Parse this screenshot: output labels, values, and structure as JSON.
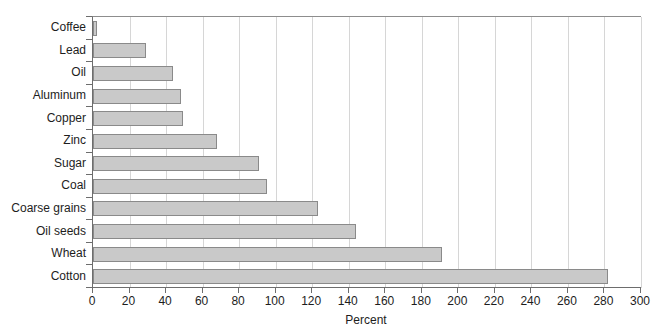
{
  "chart_data": {
    "type": "bar",
    "orientation": "horizontal",
    "title": "",
    "subtitle": "",
    "xlabel": "Percent",
    "ylabel": "",
    "categories": [
      "Coffee",
      "Lead",
      "Oil",
      "Aluminum",
      "Copper",
      "Zinc",
      "Sugar",
      "Coal",
      "Coarse grains",
      "Oil seeds",
      "Wheat",
      "Cotton"
    ],
    "values": [
      2,
      29,
      44,
      48,
      49,
      68,
      91,
      95,
      123,
      144,
      191,
      282
    ],
    "series": [
      {
        "name": "Percent",
        "values": [
          2,
          29,
          44,
          48,
          49,
          68,
          91,
          95,
          123,
          144,
          191,
          282
        ]
      }
    ],
    "xlim": [
      0,
      300
    ],
    "xticks": [
      0,
      20,
      40,
      60,
      80,
      100,
      120,
      140,
      160,
      180,
      200,
      220,
      240,
      260,
      280,
      300
    ],
    "xtick_labels": [
      "0",
      "20",
      "40",
      "60",
      "80",
      "100",
      "120",
      "140",
      "160",
      "180",
      "200",
      "220",
      "240",
      "260",
      "280",
      "300"
    ],
    "grid": {
      "vertical": true,
      "horizontal": false
    },
    "legend": {
      "visible": false,
      "position": "none"
    },
    "colors": {
      "bar_fill": "#c9c9c9",
      "bar_edge": "#8a8a8a",
      "gridline": "#d6d6d6",
      "axis": "#6d6d6d",
      "text": "#1d1d1d",
      "background": "#ffffff"
    }
  }
}
